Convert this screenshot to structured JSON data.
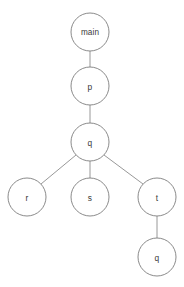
{
  "canvas": {
    "width": 184,
    "height": 287,
    "background": "#ffffff",
    "node_fill": "#ffffff",
    "node_stroke": "#7d7d7d",
    "edge_stroke": "#8c8c8c",
    "text_color": "#3a3a3a"
  },
  "diagram": {
    "type": "tree",
    "node_radius": 19,
    "nodes": [
      {
        "id": "main",
        "label": "main",
        "cx": 90,
        "cy": 32,
        "r": 19,
        "depth": 0
      },
      {
        "id": "p",
        "label": "p",
        "cx": 90,
        "cy": 86,
        "r": 19,
        "depth": 1
      },
      {
        "id": "q",
        "label": "q",
        "cx": 90,
        "cy": 142,
        "r": 19,
        "depth": 2
      },
      {
        "id": "r",
        "label": "r",
        "cx": 27,
        "cy": 197,
        "r": 19,
        "depth": 3
      },
      {
        "id": "s",
        "label": "s",
        "cx": 90,
        "cy": 197,
        "r": 19,
        "depth": 3
      },
      {
        "id": "t",
        "label": "t",
        "cx": 157,
        "cy": 197,
        "r": 19,
        "depth": 3
      },
      {
        "id": "q2",
        "label": "q",
        "cx": 157,
        "cy": 257,
        "r": 19,
        "depth": 4
      }
    ],
    "edges": [
      {
        "from": "main",
        "to": "p",
        "x1": 90,
        "y1": 51,
        "x2": 90,
        "y2": 67
      },
      {
        "from": "p",
        "to": "q",
        "x1": 90,
        "y1": 105,
        "x2": 90,
        "y2": 123
      },
      {
        "from": "q",
        "to": "r",
        "x1": 76,
        "y1": 155,
        "x2": 41,
        "y2": 184
      },
      {
        "from": "q",
        "to": "s",
        "x1": 90,
        "y1": 161,
        "x2": 90,
        "y2": 178
      },
      {
        "from": "q",
        "to": "t",
        "x1": 104,
        "y1": 155,
        "x2": 143,
        "y2": 184
      },
      {
        "from": "t",
        "to": "q2",
        "x1": 157,
        "y1": 216,
        "x2": 157,
        "y2": 238
      }
    ]
  }
}
